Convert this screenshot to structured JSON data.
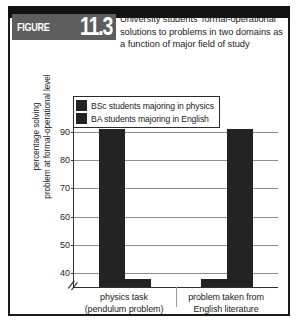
{
  "figure": {
    "label_word": "FIGURE",
    "number": "11.3",
    "caption": "University students' formal-operational solutions to problems in two domains as a function of major field of study"
  },
  "legend": {
    "entries": [
      {
        "label": "BSc students majoring in physics",
        "color": "#232323"
      },
      {
        "label": "BA students majoring in English",
        "color": "#232323"
      }
    ]
  },
  "axes": {
    "ylabel_line1": "percentage solving",
    "ylabel_line2": "problem at formal-operational level",
    "yticks": [
      "40",
      "50",
      "60",
      "70",
      "80",
      "90"
    ],
    "axis_break_symbol": "//"
  },
  "xlabels": [
    {
      "line1": "physics task",
      "line2": "(pendulum problem)"
    },
    {
      "line1": "problem taken from",
      "line2": "English literature"
    }
  ],
  "chart_data": {
    "type": "bar",
    "title": "University students' formal-operational solutions to problems in two domains as a function of major field of study",
    "xlabel": "",
    "ylabel": "percentage solving problem at formal-operational level",
    "categories": [
      "physics task (pendulum problem)",
      "problem taken from English literature"
    ],
    "series": [
      {
        "name": "BSc students majoring in physics",
        "values": [
          91,
          38
        ],
        "color": "#232323"
      },
      {
        "name": "BA students majoring in English",
        "values": [
          38,
          91
        ],
        "color": "#232323"
      }
    ],
    "ylim": [
      35,
      95
    ],
    "ytick_values": [
      40,
      50,
      60,
      70,
      80,
      90
    ],
    "axis_break": true,
    "grid": true,
    "legend_position": "top-left"
  }
}
